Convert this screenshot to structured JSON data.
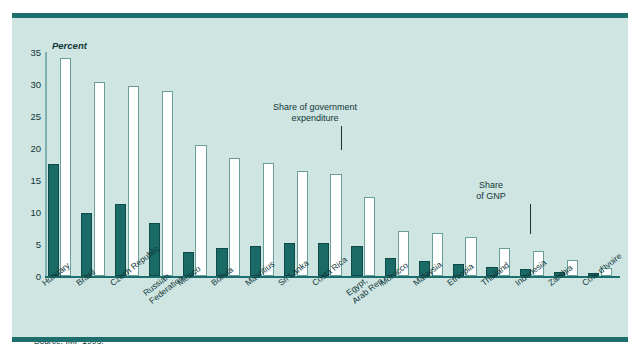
{
  "figure": {
    "title_partial": "",
    "background_color": "#cfe5e2",
    "rule_color": "#1d6f6d",
    "source_note": "Source: IMF 1995."
  },
  "annotations": [
    {
      "id": "ann-expenditure",
      "text": "Share of government\nexpenditure",
      "points_to": "Costa Rica"
    },
    {
      "id": "ann-gnp",
      "text": "Share\nof GNP",
      "points_to": "Indonesia"
    }
  ],
  "chart_data": {
    "type": "bar",
    "title": "",
    "xlabel": "",
    "ylabel": "Percent",
    "ylim": [
      0,
      35
    ],
    "yticks": [
      0,
      5,
      10,
      15,
      20,
      25,
      30,
      35
    ],
    "grid": false,
    "legend": "annotated-labels",
    "categories": [
      "Hungary",
      "Brazil",
      "Czech Republic",
      "Russian\nFederation",
      "Mexico",
      "Bolivia",
      "Mauritius",
      "Sri Lanka",
      "Costa Rica",
      "Egypt,\nArab Rep.",
      "Morocco",
      "Malaysia",
      "Ethiopia",
      "Thailand",
      "Indonesia",
      "Zambia",
      "Côte d'Ivoire"
    ],
    "series": [
      {
        "name": "Share of GNP",
        "color": "#1a6a68",
        "values": [
          17.5,
          9.9,
          11.3,
          8.3,
          3.7,
          4.4,
          4.7,
          5.2,
          5.2,
          4.7,
          2.8,
          2.3,
          1.8,
          1.4,
          1.1,
          0.6,
          0.4
        ]
      },
      {
        "name": "Share of government expenditure",
        "color": "#ffffff",
        "values": [
          34.1,
          30.3,
          29.7,
          28.9,
          20.4,
          18.4,
          17.6,
          16.4,
          15.9,
          12.4,
          7.0,
          6.7,
          6.1,
          4.4,
          3.9,
          2.5,
          1.3
        ]
      }
    ]
  }
}
